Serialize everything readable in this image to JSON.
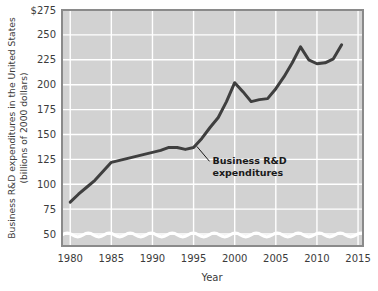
{
  "chart_data": {
    "type": "line",
    "title": "",
    "xlabel": "Year",
    "ylabel_line1": "Business R&D expenditures in the United States",
    "ylabel_line2": "(billions of 2000 dollars)",
    "xlim": [
      1979,
      2015.6
    ],
    "ylim": [
      38,
      275
    ],
    "ytick_labels": [
      "$275",
      "250",
      "225",
      "200",
      "175",
      "150",
      "125",
      "100",
      "75",
      "50"
    ],
    "ytick_values": [
      275,
      250,
      225,
      200,
      175,
      150,
      125,
      100,
      75,
      50
    ],
    "xtick_labels": [
      "1980",
      "1985",
      "1990",
      "1995",
      "2000",
      "2005",
      "2010",
      "2015"
    ],
    "xtick_values": [
      1980,
      1985,
      1990,
      1995,
      2000,
      2005,
      2010,
      2015
    ],
    "grid": true,
    "legend_position": "none",
    "axis_break": true,
    "plot_background": "#d2d2d2",
    "gridline_color": "#ffffff",
    "line_color": "#3f3f3f",
    "series": [
      {
        "name": "Business R&D expenditures",
        "x": [
          1980,
          1981,
          1982,
          1983,
          1984,
          1985,
          1986,
          1987,
          1988,
          1989,
          1990,
          1991,
          1992,
          1993,
          1994,
          1995,
          1996,
          1997,
          1998,
          1999,
          2000,
          2001,
          2002,
          2003,
          2004,
          2005,
          2006,
          2007,
          2008,
          2009,
          2010,
          2011,
          2012,
          2013
        ],
        "values": [
          82,
          90,
          97,
          104,
          113,
          122,
          124,
          126,
          128,
          130,
          132,
          134,
          137,
          137,
          135,
          137,
          146,
          157,
          167,
          183,
          202,
          193,
          183,
          185,
          186,
          196,
          208,
          222,
          238,
          225,
          221,
          222,
          226,
          240
        ]
      }
    ],
    "annotations": [
      {
        "name": "series-callout",
        "line1": "Business R&D",
        "line2": "expenditures",
        "point_x": 1995.4,
        "point_y": 138,
        "text_x": 1997.3,
        "text_y": 120
      }
    ]
  }
}
